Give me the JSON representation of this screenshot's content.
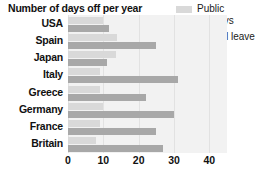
{
  "chart_data": {
    "type": "bar",
    "orientation": "horizontal",
    "title": "Number of days off per year",
    "xlabel": "",
    "ylabel": "",
    "categories": [
      "USA",
      "Spain",
      "Japan",
      "Italy",
      "Greece",
      "Germany",
      "France",
      "Britain"
    ],
    "series": [
      {
        "name": "Public holidays",
        "color": "#d9d9d9",
        "values": [
          10,
          14,
          13.5,
          9,
          9,
          10,
          9,
          8
        ]
      },
      {
        "name": "Annual leave",
        "color": "#a8a8a8",
        "values": [
          11.5,
          25,
          11,
          31,
          22,
          30,
          25,
          27
        ]
      }
    ],
    "xlim": [
      0,
      45
    ],
    "xticks": [
      0,
      10,
      20,
      30,
      40
    ],
    "xtick_labels": [
      "0",
      "10",
      "20",
      "30",
      "40"
    ],
    "grid": true,
    "grid_axis": "x",
    "legend_position": "top-right",
    "plot_background": "#f2f2f2"
  },
  "legend": {
    "entries": [
      {
        "label": "Public holidays",
        "color": "#d9d9d9"
      },
      {
        "label": "Annual leave",
        "color": "#a8a8a8"
      }
    ]
  }
}
